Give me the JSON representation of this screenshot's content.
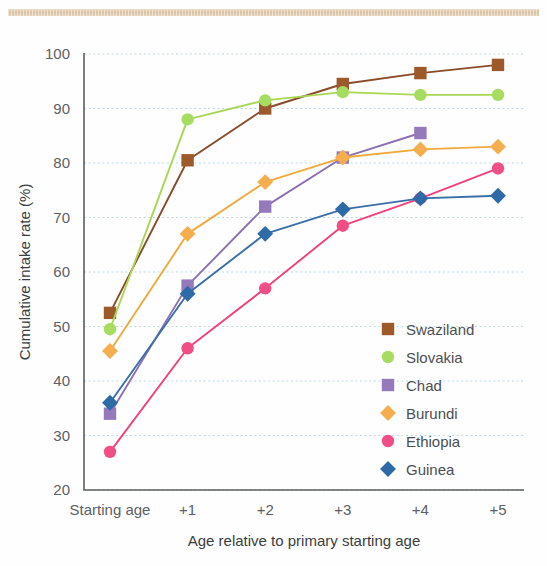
{
  "decor": {
    "top_band_color": "#d8bfa0"
  },
  "chart_data": {
    "type": "line",
    "title": "",
    "xlabel": "Age relative to primary starting age",
    "ylabel": "Cumulative intake rate (%)",
    "categories": [
      "Starting age",
      "+1",
      "+2",
      "+3",
      "+4",
      "+5"
    ],
    "ylim": [
      20,
      100
    ],
    "yticks": [
      20,
      30,
      40,
      50,
      60,
      70,
      80,
      90,
      100
    ],
    "grid": true,
    "legend_position": "inside-right",
    "series": [
      {
        "name": "Swaziland",
        "color": "#8a4b2a",
        "marker_color": "#9c5a2b",
        "marker": "square",
        "values": [
          52.5,
          80.5,
          90.0,
          94.5,
          96.5,
          98.0
        ]
      },
      {
        "name": "Slovakia",
        "color": "#a8d755",
        "marker_color": "#a6dd61",
        "marker": "circle",
        "values": [
          49.5,
          88.0,
          91.5,
          93.0,
          92.5,
          92.5
        ]
      },
      {
        "name": "Chad",
        "color": "#8b6fb5",
        "marker_color": "#9479bb",
        "marker": "square",
        "values": [
          34.0,
          57.5,
          72.0,
          81.0,
          85.5,
          null
        ]
      },
      {
        "name": "Burundi",
        "color": "#f0a93c",
        "marker_color": "#f5ae4e",
        "marker": "diamond",
        "values": [
          45.5,
          67.0,
          76.5,
          81.0,
          82.5,
          83.0
        ]
      },
      {
        "name": "Ethiopia",
        "color": "#ef417b",
        "marker_color": "#f04e84",
        "marker": "circle",
        "values": [
          27.0,
          46.0,
          57.0,
          68.5,
          73.5,
          79.0
        ]
      },
      {
        "name": "Guinea",
        "color": "#3a6ea8",
        "marker_color": "#2f6aa8",
        "marker": "diamond",
        "values": [
          36.0,
          56.0,
          67.0,
          71.5,
          73.5,
          74.0
        ]
      }
    ]
  }
}
